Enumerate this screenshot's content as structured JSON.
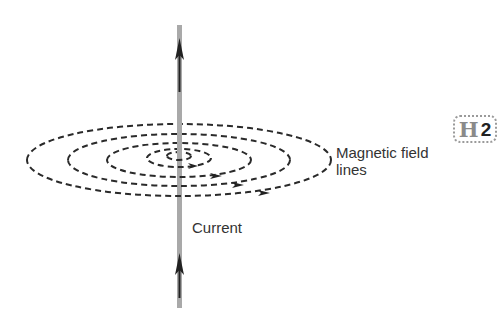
{
  "diagram": {
    "labels": {
      "field_line1": "Magnetic field",
      "field_line2": "lines",
      "current": "Current"
    },
    "badge": {
      "letter": "H",
      "number": "2"
    },
    "colors": {
      "wire": "#a9a9a9",
      "field_lines": "#2a2a2a",
      "arrow": "#222222",
      "text": "#333333"
    },
    "field_lines": [
      {
        "rx": 152,
        "ry": 36
      },
      {
        "rx": 111,
        "ry": 26
      },
      {
        "rx": 72,
        "ry": 17
      },
      {
        "rx": 32,
        "ry": 9
      },
      {
        "rx": 12,
        "ry": 4
      }
    ],
    "current_direction": "up",
    "field_direction": "counterclockwise (viewed from above)"
  }
}
